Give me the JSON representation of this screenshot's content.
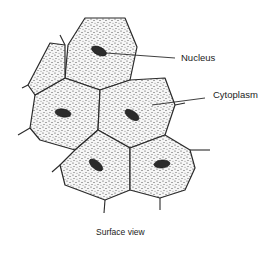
{
  "figure": {
    "caption": "Surface view"
  },
  "labels": {
    "nucleus": "Nucleus",
    "cytoplasm": "Cytoplasm"
  },
  "colors": {
    "outline": "#2a2a2a",
    "stipple": "#3a3a3a",
    "nucleus": "#2b2b2b",
    "background": "#ffffff"
  },
  "cells": [
    {
      "id": "top",
      "points": "85,18 125,18 137,47 130,80 100,90 65,78 68,45",
      "nucleus": {
        "cx": 99,
        "cy": 51,
        "rx": 8,
        "ry": 4,
        "rot": 25
      }
    },
    {
      "id": "middle-left",
      "points": "35,95 65,78 100,90 98,130 75,150 40,140 30,128",
      "nucleus": {
        "cx": 63,
        "cy": 113,
        "rx": 8,
        "ry": 4,
        "rot": 10
      }
    },
    {
      "id": "middle-right",
      "points": "100,90 130,80 165,78 175,105 165,135 130,148 98,130",
      "nucleus": {
        "cx": 132,
        "cy": 115,
        "rx": 8,
        "ry": 4,
        "rot": 35
      }
    },
    {
      "id": "bottom-left",
      "points": "75,150 98,130 130,148 130,190 105,200 65,185 60,165",
      "nucleus": {
        "cx": 96,
        "cy": 165,
        "rx": 8,
        "ry": 4,
        "rot": 40
      }
    },
    {
      "id": "bottom-right",
      "points": "130,148 165,135 190,150 195,168 185,190 160,198 130,190",
      "nucleus": {
        "cx": 162,
        "cy": 164,
        "rx": 8,
        "ry": 4,
        "rot": -5
      }
    },
    {
      "id": "partial-left",
      "points": "50,43 65,45 65,78 35,95 28,85",
      "nucleus": null
    }
  ]
}
